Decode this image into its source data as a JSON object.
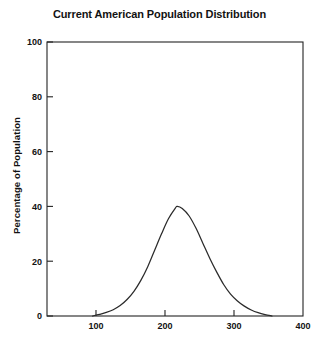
{
  "chart_data": {
    "type": "line",
    "title": "Current American Population Distribution",
    "xlabel": "",
    "ylabel": "Percentage of Population",
    "xlim": [
      29,
      400
    ],
    "ylim": [
      0,
      100
    ],
    "grid": false,
    "legend": null,
    "xticks": [
      100,
      200,
      300,
      400
    ],
    "yticks": [
      0,
      20,
      40,
      60,
      80,
      100
    ],
    "xtick_labels": [
      "100",
      "200",
      "300",
      "400"
    ],
    "ytick_labels": [
      "0",
      "20",
      "40",
      "60",
      "80",
      "100"
    ],
    "curve_description": "Single smooth bell-shaped (normal) distribution curve peaking near 40 percent at x = 218, meeting the baseline near x = 95 and x = 355",
    "series": [
      {
        "name": "Population distribution",
        "color": "#2b2b2b",
        "x": [
          95,
          105,
          115,
          125,
          135,
          145,
          155,
          165,
          175,
          185,
          195,
          205,
          215,
          218,
          225,
          235,
          245,
          255,
          265,
          275,
          285,
          295,
          305,
          315,
          325,
          335,
          345,
          355
        ],
        "y": [
          0.0,
          0.6,
          1.3,
          2.3,
          3.8,
          6.0,
          9.0,
          13.0,
          18.0,
          24.0,
          30.0,
          35.5,
          39.4,
          40.0,
          39.2,
          36.5,
          32.0,
          26.5,
          21.0,
          16.0,
          11.5,
          8.0,
          5.5,
          3.6,
          2.2,
          1.2,
          0.5,
          0.0
        ]
      }
    ]
  },
  "axes": {
    "title": "Current American Population Distribution",
    "y_axis_title": "Percentage of Population"
  }
}
